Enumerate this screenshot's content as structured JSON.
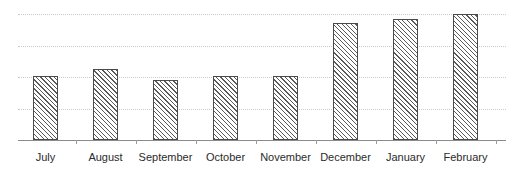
{
  "chart_data": {
    "type": "bar",
    "title": "",
    "subtitle": "",
    "xlabel": "",
    "ylabel": "",
    "categories": [
      "July",
      "August",
      "September",
      "October",
      "November",
      "December",
      "January",
      "February"
    ],
    "values": [
      51,
      56,
      48,
      51,
      51,
      93,
      96,
      100
    ],
    "series": [
      {
        "name": "",
        "values": [
          51,
          56,
          48,
          51,
          51,
          93,
          96,
          100
        ]
      }
    ],
    "ylim": [
      0,
      100
    ],
    "gridlines": [
      25,
      50,
      75,
      100
    ],
    "grid": true,
    "grid_style": "dotted",
    "legend": false,
    "legend_position": "none",
    "bar_fill": "diagonal-hatch",
    "bar_edge_color": "#4a4a4a",
    "bar_hatch_color": "#5a5a5a",
    "grid_color": "#c9c9c9",
    "axis_color": "#8a8a8a",
    "label_color": "#2b2b2b",
    "background_color": "#ffffff",
    "tick_labels_y": [],
    "annotations": []
  },
  "chart": {
    "labels": [
      {
        "text": "July"
      },
      {
        "text": "August"
      },
      {
        "text": "September"
      },
      {
        "text": "October"
      },
      {
        "text": "November"
      },
      {
        "text": "December"
      },
      {
        "text": "January"
      },
      {
        "text": "February"
      }
    ]
  }
}
